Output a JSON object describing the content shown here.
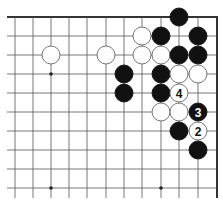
{
  "diagram": {
    "type": "go-board-fragment",
    "title": "",
    "board_colors": {
      "background": "#ffffff",
      "line": "#555555",
      "edge": "#333333",
      "black_stone": "#111111",
      "white_stone": "#ffffff"
    },
    "grid": {
      "columns_x": [
        15,
        33,
        51,
        69,
        87,
        106,
        124,
        142,
        161,
        179,
        198
      ],
      "rows_y": [
        17,
        36,
        55,
        74,
        93,
        112,
        131,
        150,
        169,
        188
      ],
      "right_edge_x": 217,
      "top_edge_y": 17,
      "left_extent_x": 7,
      "bottom_extent_y": 198
    },
    "star_points": [
      {
        "col": 2,
        "row": 3
      },
      {
        "col": 2,
        "row": 9
      },
      {
        "col": 8,
        "row": 9
      }
    ],
    "stones": [
      {
        "color": "black",
        "col": 9,
        "row": 0,
        "label": ""
      },
      {
        "color": "white",
        "col": 7,
        "row": 1,
        "label": ""
      },
      {
        "color": "black",
        "col": 8,
        "row": 1,
        "label": ""
      },
      {
        "color": "black",
        "col": 10,
        "row": 1,
        "label": ""
      },
      {
        "color": "white",
        "col": 2,
        "row": 2,
        "label": ""
      },
      {
        "color": "white",
        "col": 5,
        "row": 2,
        "label": ""
      },
      {
        "color": "white",
        "col": 7,
        "row": 2,
        "label": ""
      },
      {
        "color": "white",
        "col": 8,
        "row": 2,
        "label": ""
      },
      {
        "color": "black",
        "col": 9,
        "row": 2,
        "label": ""
      },
      {
        "color": "black",
        "col": 10,
        "row": 2,
        "label": ""
      },
      {
        "color": "black",
        "col": 6,
        "row": 3,
        "label": ""
      },
      {
        "color": "black",
        "col": 8,
        "row": 3,
        "label": ""
      },
      {
        "color": "white",
        "col": 9,
        "row": 3,
        "label": ""
      },
      {
        "color": "white",
        "col": 10,
        "row": 3,
        "label": ""
      },
      {
        "color": "black",
        "col": 6,
        "row": 4,
        "label": ""
      },
      {
        "color": "black",
        "col": 8,
        "row": 4,
        "label": ""
      },
      {
        "color": "white",
        "col": 9,
        "row": 4,
        "label": "4"
      },
      {
        "color": "white",
        "col": 8,
        "row": 5,
        "label": ""
      },
      {
        "color": "white",
        "col": 9,
        "row": 5,
        "label": ""
      },
      {
        "color": "black",
        "col": 10,
        "row": 5,
        "label": "3"
      },
      {
        "color": "black",
        "col": 9,
        "row": 6,
        "label": ""
      },
      {
        "color": "white",
        "col": 10,
        "row": 6,
        "label": "2"
      },
      {
        "color": "black",
        "col": 10,
        "row": 7,
        "label": ""
      }
    ]
  }
}
